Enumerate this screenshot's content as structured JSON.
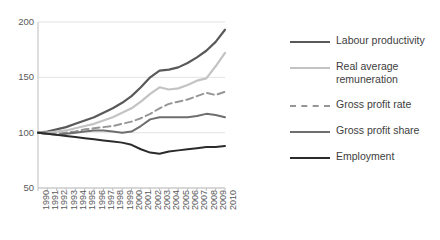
{
  "chart_data": {
    "type": "line",
    "title": "",
    "subtitle": "",
    "xlabel": "",
    "ylabel": "",
    "xlim": [
      1990,
      2010
    ],
    "ylim": [
      50,
      200
    ],
    "yticks": [
      50,
      100,
      150,
      200
    ],
    "grid": "horizontal",
    "legend_position": "right",
    "index_base": "1990 = 100",
    "x": [
      1990,
      1991,
      1992,
      1993,
      1994,
      1995,
      1996,
      1997,
      1998,
      1999,
      2000,
      2001,
      2002,
      2003,
      2004,
      2005,
      2006,
      2007,
      2008,
      2009,
      2010
    ],
    "categories": [
      "1990",
      "1991",
      "1992",
      "1993",
      "1994",
      "1995",
      "1996",
      "1997",
      "1998",
      "1999",
      "2000",
      "2001",
      "2002",
      "2003",
      "2004",
      "2005",
      "2006",
      "2007",
      "2008",
      "2009",
      "2010"
    ],
    "series": [
      {
        "name": "Labour productivity",
        "color": "#595959",
        "style": "solid",
        "width": 2.2,
        "values": [
          100,
          101,
          103,
          105,
          108,
          111,
          114,
          118,
          122,
          127,
          133,
          141,
          150,
          156,
          157,
          159,
          163,
          168,
          174,
          182,
          193
        ]
      },
      {
        "name": "Real average remuneration",
        "color": "#c3c3c3",
        "style": "solid",
        "width": 2.2,
        "values": [
          100,
          100,
          101,
          102,
          104,
          106,
          108,
          111,
          114,
          118,
          122,
          128,
          135,
          141,
          139,
          140,
          143,
          147,
          149,
          160,
          172
        ]
      },
      {
        "name": "Gross profit rate",
        "color": "#969696",
        "style": "dashed",
        "width": 2.0,
        "values": [
          100,
          99,
          99,
          100,
          101,
          103,
          104,
          105,
          106,
          108,
          110,
          113,
          117,
          122,
          126,
          128,
          130,
          133,
          136,
          134,
          137
        ]
      },
      {
        "name": "Gross profit share",
        "color": "#6e6e6e",
        "style": "solid",
        "width": 2.0,
        "values": [
          100,
          99,
          98,
          99,
          100,
          101,
          102,
          102,
          101,
          100,
          101,
          106,
          112,
          114,
          114,
          114,
          114,
          115,
          117,
          116,
          114
        ]
      },
      {
        "name": "Employment",
        "color": "#2b2b2b",
        "style": "solid",
        "width": 2.0,
        "values": [
          100,
          99,
          98,
          97,
          96,
          95,
          94,
          93,
          92,
          91,
          89,
          85,
          82,
          81,
          83,
          84,
          85,
          86,
          87,
          87,
          88
        ]
      }
    ]
  },
  "axes": {
    "y_ticks": [
      "200",
      "150",
      "100",
      "50"
    ],
    "x_ticks": [
      "1990",
      "1991",
      "1992",
      "1993",
      "1994",
      "1995",
      "1996",
      "1997",
      "1998",
      "1999",
      "2000",
      "2001",
      "2002",
      "2003",
      "2004",
      "2005",
      "2006",
      "2007",
      "2008",
      "2009",
      "2010"
    ]
  },
  "legend": {
    "items": [
      {
        "label": "Labour productivity",
        "color": "#595959",
        "style": "solid"
      },
      {
        "label": "Real average remuneration",
        "color": "#c3c3c3",
        "style": "solid"
      },
      {
        "label": "Gross profit rate",
        "color": "#969696",
        "style": "dashed"
      },
      {
        "label": "Gross profit share",
        "color": "#6e6e6e",
        "style": "solid"
      },
      {
        "label": "Employment",
        "color": "#2b2b2b",
        "style": "solid"
      }
    ]
  },
  "colors": {
    "axis": "#bfbfbf",
    "grid": "#e3e3e3",
    "tick_text": "#595959",
    "legend_text": "#3d3d3d",
    "background": "#ffffff"
  }
}
